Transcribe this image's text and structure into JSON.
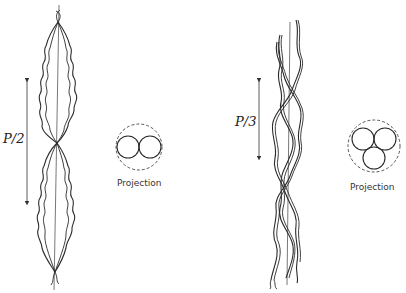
{
  "panels": [
    {
      "id": "two-strand",
      "pitch_label": "P/2",
      "projection_label": "Projection",
      "strand_count": 2
    },
    {
      "id": "three-strand",
      "pitch_label": "P/3",
      "projection_label": "Projection",
      "strand_count": 3
    }
  ],
  "colors": {
    "ink": "#2a2a2a",
    "background": "#ffffff"
  }
}
